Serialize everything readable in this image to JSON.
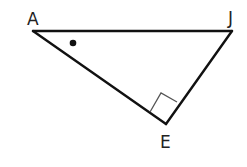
{
  "diagram": {
    "type": "right-triangle",
    "vertices": {
      "A": {
        "label": "A",
        "x": 33,
        "y": 31
      },
      "J": {
        "label": "J",
        "x": 232,
        "y": 31
      },
      "E": {
        "label": "E",
        "x": 166,
        "y": 124
      }
    },
    "labels": {
      "A": "A",
      "J": "J",
      "E": "E"
    },
    "right_angle_at": "E",
    "angle_marker_at": "A",
    "angle_marker_style": "dot",
    "colors": {
      "stroke": "#111111",
      "right_angle_box": "#555555",
      "background": "#ffffff"
    }
  }
}
